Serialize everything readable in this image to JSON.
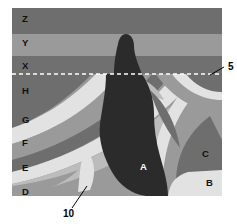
{
  "figure": {
    "name": "geologic-cross-section",
    "kind": "diagram",
    "frame": {
      "x": 12,
      "y": 8,
      "width": 210,
      "height": 188
    },
    "background_color": "#ffffff"
  },
  "palette": {
    "layer_z": "#6e6e6e",
    "layer_y": "#9a9a9a",
    "layer_x": "#707070",
    "dark_band": "#6e6e6e",
    "mid_band": "#9a9a9a",
    "light_band": "#bcbcbc",
    "pale_band": "#e2e2e2",
    "intrusion": "#2b2b2b",
    "unconformity": "#ffffff",
    "label_dark": "#111111",
    "label_light": "#ffffff",
    "leader_line": "#000000"
  },
  "unit_labels": [
    {
      "id": "Z",
      "text": "Z",
      "x": 22,
      "y": 22,
      "tone": "dark"
    },
    {
      "id": "Y",
      "text": "Y",
      "x": 22,
      "y": 46,
      "tone": "dark"
    },
    {
      "id": "X",
      "text": "X",
      "x": 22,
      "y": 69,
      "tone": "dark"
    },
    {
      "id": "H",
      "text": "H",
      "x": 22,
      "y": 94,
      "tone": "dark"
    },
    {
      "id": "G",
      "text": "G",
      "x": 22,
      "y": 123,
      "tone": "dark"
    },
    {
      "id": "F",
      "text": "F",
      "x": 22,
      "y": 146,
      "tone": "dark"
    },
    {
      "id": "E",
      "text": "E",
      "x": 22,
      "y": 171,
      "tone": "dark"
    },
    {
      "id": "D",
      "text": "D",
      "x": 22,
      "y": 195,
      "tone": "dark"
    },
    {
      "id": "C",
      "text": "C",
      "x": 202,
      "y": 157,
      "tone": "dark"
    },
    {
      "id": "B",
      "text": "B",
      "x": 206,
      "y": 186,
      "tone": "dark"
    },
    {
      "id": "A",
      "text": "A",
      "x": 140,
      "y": 170,
      "tone": "light"
    }
  ],
  "callouts": [
    {
      "id": "5",
      "text": "5",
      "text_x": 228,
      "text_y": 70,
      "leader": "M 224,67 L 210,75",
      "target": "unconformity-dashed-line"
    },
    {
      "id": "10",
      "text": "10",
      "text_x": 67,
      "text_y": 217,
      "leader": "M 72,208 L 87,186",
      "target": "pale-wedge-lower-left"
    }
  ],
  "geology": {
    "upper_sequence": [
      "Z",
      "Y",
      "X"
    ],
    "lower_sequence": [
      "H",
      "G",
      "F",
      "E",
      "D",
      "C",
      "B"
    ],
    "intrusion_unit": "A",
    "unconformity_label": "5",
    "wedge_label": "10"
  }
}
